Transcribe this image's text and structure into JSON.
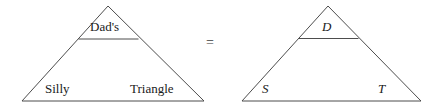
{
  "figure": {
    "stroke_color": "#4d4d4d",
    "text_color": "#1a1a1a",
    "background": "#ffffff",
    "equals_symbol": "=",
    "left_triangle": {
      "name": "worded-triangle",
      "apex_label": "Dad's",
      "bottom_left_label": "Silly",
      "bottom_right_label": "Triangle"
    },
    "right_triangle": {
      "name": "lettered-triangle",
      "apex_label": "D",
      "bottom_left_label": "S",
      "bottom_right_label": "T"
    }
  }
}
